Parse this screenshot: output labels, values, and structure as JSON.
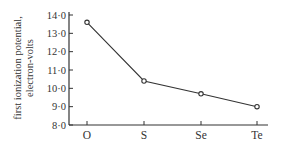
{
  "chart_data": {
    "type": "line",
    "title": "",
    "xlabel": "",
    "ylabel": "first ionization potential, electron-volts",
    "ylabel_lines": [
      "first ionization potential,",
      "electron-volts"
    ],
    "categories": [
      "O",
      "S",
      "Se",
      "Te"
    ],
    "series": [
      {
        "name": "first ionization potential",
        "values": [
          13.6,
          10.4,
          9.7,
          9.0
        ]
      }
    ],
    "yticks": [
      "8·0",
      "9·0",
      "10·0",
      "11·0",
      "12·0",
      "13·0",
      "14·0"
    ],
    "ylim": [
      8.0,
      14.0
    ],
    "grid": false,
    "legend": "none",
    "marker": "open-circle",
    "line_color": "#333333"
  }
}
